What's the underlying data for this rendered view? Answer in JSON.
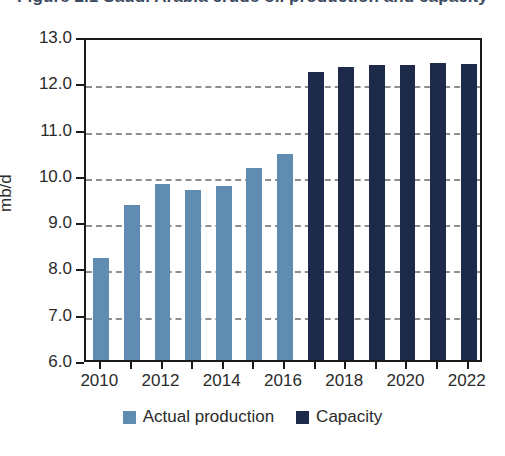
{
  "chart_data": {
    "type": "bar",
    "title": "Figure 2.1 Saudi Arabia crude oil production and capacity",
    "title_clipped": true,
    "xlabel": "",
    "ylabel": "mb/d",
    "ylim": [
      6.0,
      13.0
    ],
    "ytick_step": 1.0,
    "ytick_labels": [
      "13.0",
      "12.0",
      "11.0",
      "10.0",
      "9.0",
      "8.0",
      "7.0",
      "6.0"
    ],
    "ytick_values": [
      13.0,
      12.0,
      11.0,
      10.0,
      9.0,
      8.0,
      7.0,
      6.0
    ],
    "grid": "horizontal-dashed",
    "legend_position": "bottom-center",
    "categories": [
      2010,
      2011,
      2012,
      2013,
      2014,
      2015,
      2016,
      2017,
      2018,
      2019,
      2020,
      2021,
      2022
    ],
    "xtick_labels": [
      "2010",
      "2012",
      "2014",
      "2016",
      "2018",
      "2020",
      "2022"
    ],
    "xtick_values": [
      2010,
      2012,
      2014,
      2016,
      2018,
      2020,
      2022
    ],
    "series": [
      {
        "name": "Actual production",
        "color": "#5f8cb0",
        "x": [
          2010,
          2011,
          2012,
          2013,
          2014,
          2015,
          2016
        ],
        "values": [
          8.2,
          9.35,
          9.8,
          9.67,
          9.75,
          10.15,
          10.45
        ]
      },
      {
        "name": "Capacity",
        "color": "#1e2a4a",
        "x": [
          2017,
          2018,
          2019,
          2020,
          2021,
          2022
        ],
        "values": [
          12.23,
          12.33,
          12.37,
          12.38,
          12.42,
          12.4
        ]
      }
    ]
  },
  "legend": {
    "items": [
      {
        "label": "Actual production",
        "color": "#5f8cb0"
      },
      {
        "label": "Capacity",
        "color": "#1e2a4a"
      }
    ]
  },
  "axes": {
    "y_title": "mb/d"
  }
}
